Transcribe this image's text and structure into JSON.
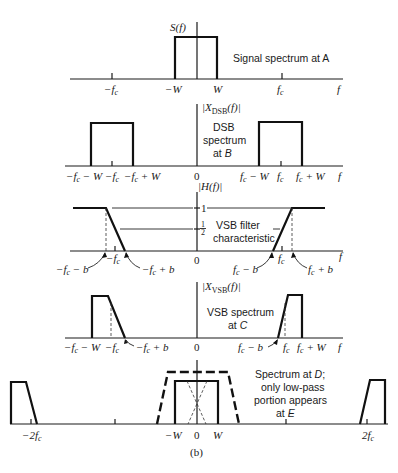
{
  "figure": {
    "caption": "(b)",
    "panels": [
      {
        "id": "signal",
        "ylabel": "S(f)",
        "description": "Signal spectrum at A",
        "ticks": [
          "−f_c",
          "−W",
          "W",
          "f_c",
          "f"
        ],
        "tick_display": {
          "neg_fc": "−f",
          "neg_w": "−W",
          "w": "W",
          "fc": "f",
          "f": "f",
          "sub_c": "c"
        }
      },
      {
        "id": "dsb",
        "ylabel": "|X_DSB(f)|",
        "ylabel_main": "|X",
        "ylabel_sub": "DSB",
        "ylabel_tail": "(f)|",
        "description_lines": [
          "DSB",
          "spectrum",
          "at B"
        ],
        "ticks": [
          "−f_c − W",
          "−f_c",
          "−f_c + W",
          "0",
          "f_c − W",
          "f_c",
          "f_c + W",
          "f"
        ],
        "tick_display": {
          "zero": "0"
        }
      },
      {
        "id": "vsb_filter",
        "ylabel": "|H(f)|",
        "levels": [
          "1",
          "1/2"
        ],
        "level_one": "1",
        "half_num": "1",
        "half_den": "2",
        "description_lines": [
          "VSB filter",
          "characteristic"
        ],
        "ticks": [
          "−f_c − b",
          "−f_c",
          "−f_c + b",
          "0",
          "f_c − b",
          "f_c",
          "f_c + b",
          "f"
        ]
      },
      {
        "id": "vsb_spectrum",
        "ylabel": "|X_VSB(f)|",
        "ylabel_sub": "VSB",
        "description_lines": [
          "VSB spectrum",
          "at C"
        ],
        "ticks": [
          "−f_c − W",
          "−f_c",
          "−f_c + b",
          "0",
          "f_c − b",
          "f_c",
          "f_c + W",
          "f"
        ]
      },
      {
        "id": "demod",
        "description_lines": [
          "Spectrum at D;",
          "only low-pass",
          "portion appears",
          "at E"
        ],
        "ticks": [
          "−2f_c",
          "−W",
          "0",
          "W",
          "2f_c"
        ]
      }
    ]
  }
}
